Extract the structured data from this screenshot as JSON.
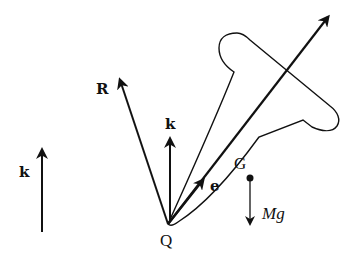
{
  "diagram": {
    "colors": {
      "ink": "#111111",
      "background": "#ffffff"
    },
    "labels": {
      "reaction_force": "R",
      "vertical_unit_body": "k",
      "vertical_unit_reference": "k",
      "axis_unit": "e",
      "center_of_mass": "G",
      "pivot": "Q",
      "weight_M": "M",
      "weight_g": "g"
    },
    "elements": [
      {
        "id": "reaction-force-arrow",
        "label": "R",
        "direction": "up-left from Q"
      },
      {
        "id": "body-k-arrow",
        "label": "k",
        "direction": "vertical up from Q"
      },
      {
        "id": "axis-arrow",
        "label": "e",
        "direction": "along body axis through G"
      },
      {
        "id": "weight-arrow",
        "label": "Mg",
        "direction": "vertical down from G"
      },
      {
        "id": "reference-k-arrow",
        "label": "k",
        "direction": "vertical up, standalone"
      }
    ]
  }
}
